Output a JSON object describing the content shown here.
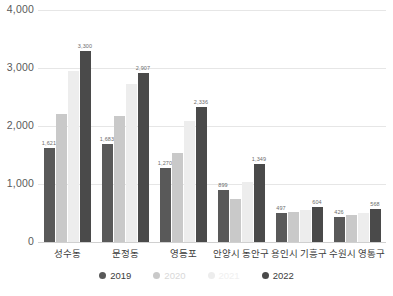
{
  "chart_data": {
    "type": "bar",
    "title": "",
    "xlabel": "",
    "ylabel": "",
    "ylim": [
      0,
      4000
    ],
    "yticks": [
      0,
      1000,
      2000,
      3000,
      4000
    ],
    "ytick_labels": [
      "0",
      "1,000",
      "2,000",
      "3,000",
      "4,000"
    ],
    "grid": true,
    "legend_position": "bottom",
    "categories": [
      "성수동",
      "문정동",
      "영등포",
      "안양시 동안구",
      "용인시 기흥구",
      "수원시 영통구"
    ],
    "series": [
      {
        "name": "2019",
        "color": "#595959",
        "values": [
          1621,
          1683,
          1270,
          899,
          497,
          426
        ],
        "labels": [
          "1,621",
          "1,683",
          "1,270",
          "899",
          "497",
          "426"
        ],
        "show_labels": true
      },
      {
        "name": "2020",
        "color": "#c9c9c9",
        "values": [
          2200,
          2170,
          1530,
          750,
          520,
          470
        ],
        "labels": [
          "",
          "",
          "",
          "",
          "",
          ""
        ],
        "show_labels": false
      },
      {
        "name": "2021",
        "color": "#ededed",
        "values": [
          2950,
          2720,
          2080,
          1030,
          560,
          500
        ],
        "labels": [
          "",
          "",
          "",
          "",
          "",
          ""
        ],
        "show_labels": false
      },
      {
        "name": "2022",
        "color": "#4a4a4a",
        "values": [
          3300,
          2907,
          2336,
          1349,
          604,
          568
        ],
        "labels": [
          "3,300",
          "2,907",
          "2,336",
          "1,349",
          "604",
          "568"
        ],
        "show_labels": true
      }
    ]
  },
  "colors": {
    "series_2019": "#595959",
    "series_2020": "#c9c9c9",
    "series_2021": "#ededed",
    "series_2022": "#4a4a4a",
    "gridline": "#e6e6e6",
    "axis_text": "#5a5a5a",
    "category_text": "#3c3c3c",
    "label_text": "#6d6d6d",
    "background": "#ffffff"
  }
}
